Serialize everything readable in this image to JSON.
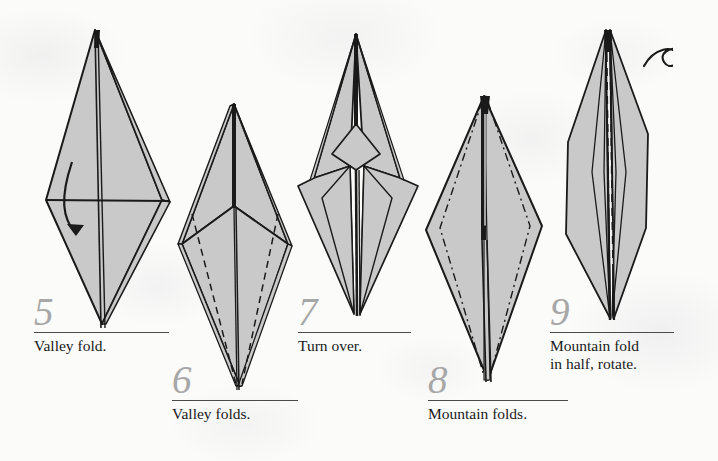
{
  "page": {
    "background_color": "#fbfbfa",
    "paper_fill_color": "#c9c9c9",
    "ink_color": "#1a1a1a",
    "number_color": "#a7a7a7"
  },
  "steps": [
    {
      "number": "5",
      "caption": "Valley fold.",
      "figure_name": "kite-diamond-with-valley-arrow",
      "annotations": [
        "curved-valley-arrow"
      ]
    },
    {
      "number": "6",
      "caption": "Valley folds.",
      "figure_name": "diamond-with-dashed-valley-creases",
      "annotations": [
        "dashed-valley-crease-left",
        "dashed-valley-crease-right"
      ]
    },
    {
      "number": "7",
      "caption": "Turn over.",
      "figure_name": "narrowed-kite-after-valley-folds",
      "annotations": []
    },
    {
      "number": "8",
      "caption": "Mountain folds.",
      "figure_name": "slim-diamond-with-dashdot-mountain-creases",
      "annotations": [
        "dashdot-mountain-crease-left",
        "dashdot-mountain-crease-right"
      ]
    },
    {
      "number": "9",
      "caption": "Mountain fold\nin half, rotate.",
      "figure_name": "narrow-elongated-model-with-center-crease",
      "annotations": [
        "turn-over-loop-arrow"
      ]
    }
  ]
}
